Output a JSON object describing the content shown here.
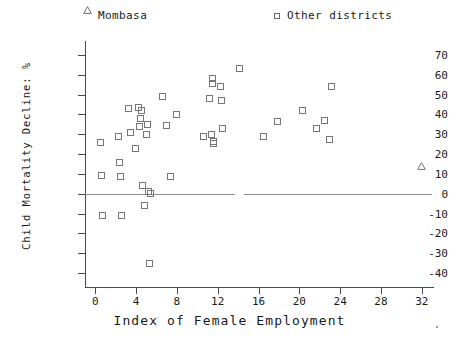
{
  "chart_data": {
    "type": "scatter",
    "title": "",
    "xlabel": "Index of Female Employment",
    "ylabel": "Child Mortality Decline: %",
    "xlim": [
      -1,
      33
    ],
    "ylim": [
      -45,
      75
    ],
    "xticks": [
      0,
      4,
      8,
      12,
      16,
      20,
      24,
      28,
      32
    ],
    "xticklabels": [
      "0",
      "4",
      "8",
      "12",
      "16",
      "20",
      "24",
      "28",
      "32"
    ],
    "yticks": [
      70,
      60,
      50,
      40,
      30,
      20,
      10,
      0,
      -10,
      -20,
      -30,
      -40
    ],
    "yticklabels": [
      "70",
      "60",
      "50",
      "40",
      "30",
      "20",
      "10",
      "0",
      "-10",
      "-20",
      "-30",
      "-40"
    ],
    "grid": false,
    "legend_position": "top",
    "reference_lines": [
      {
        "orientation": "horizontal",
        "y": 0,
        "segments": [
          [
            -1,
            13.7
          ],
          [
            14.6,
            33
          ]
        ]
      }
    ],
    "series": [
      {
        "name": "Mombasa",
        "marker": "triangle",
        "points": [
          {
            "x": 32.0,
            "y": 17.5
          }
        ]
      },
      {
        "name": "Other districts",
        "marker": "square",
        "points": [
          {
            "x": 0.5,
            "y": 26.0
          },
          {
            "x": 0.6,
            "y": 9.0
          },
          {
            "x": 0.7,
            "y": -11.0
          },
          {
            "x": 2.3,
            "y": 29.0
          },
          {
            "x": 2.4,
            "y": 16.0
          },
          {
            "x": 2.5,
            "y": 8.5
          },
          {
            "x": 2.6,
            "y": -11.0
          },
          {
            "x": 3.3,
            "y": 43.0
          },
          {
            "x": 3.5,
            "y": 31.0
          },
          {
            "x": 3.9,
            "y": 23.0
          },
          {
            "x": 4.2,
            "y": 43.5
          },
          {
            "x": 4.5,
            "y": 42.0
          },
          {
            "x": 4.4,
            "y": 38.0
          },
          {
            "x": 4.3,
            "y": 34.0
          },
          {
            "x": 4.6,
            "y": 4.0
          },
          {
            "x": 4.8,
            "y": -6.0
          },
          {
            "x": 5.2,
            "y": 1.0
          },
          {
            "x": 5.4,
            "y": 0.0
          },
          {
            "x": 5.1,
            "y": 35.0
          },
          {
            "x": 5.0,
            "y": 30.0
          },
          {
            "x": 5.3,
            "y": -35.0
          },
          {
            "x": 6.6,
            "y": 49.0
          },
          {
            "x": 7.0,
            "y": 34.5
          },
          {
            "x": 7.4,
            "y": 8.5
          },
          {
            "x": 8.0,
            "y": 40.0
          },
          {
            "x": 11.2,
            "y": 48.0
          },
          {
            "x": 11.5,
            "y": 58.0
          },
          {
            "x": 11.5,
            "y": 55.5
          },
          {
            "x": 11.4,
            "y": 30.0
          },
          {
            "x": 11.6,
            "y": 26.5
          },
          {
            "x": 11.6,
            "y": 25.5
          },
          {
            "x": 10.6,
            "y": 29.0
          },
          {
            "x": 12.3,
            "y": 54.0
          },
          {
            "x": 12.4,
            "y": 47.0
          },
          {
            "x": 12.5,
            "y": 33.0
          },
          {
            "x": 14.1,
            "y": 63.0
          },
          {
            "x": 16.5,
            "y": 29.0
          },
          {
            "x": 17.9,
            "y": 36.5
          },
          {
            "x": 20.3,
            "y": 42.0
          },
          {
            "x": 21.7,
            "y": 33.0
          },
          {
            "x": 22.5,
            "y": 37.0
          },
          {
            "x": 23.2,
            "y": 54.0
          },
          {
            "x": 23.0,
            "y": 27.5
          }
        ]
      }
    ]
  },
  "legend": {
    "entries": [
      {
        "label": "Mombasa",
        "marker": "triangle"
      },
      {
        "label": "Other districts",
        "marker": "square"
      }
    ]
  }
}
